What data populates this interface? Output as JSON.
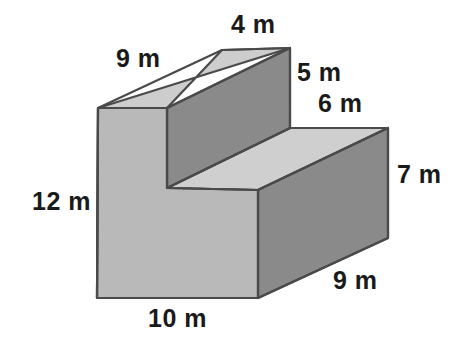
{
  "figure": {
    "unit": "m",
    "background_color": "#ffffff",
    "outline_color": "#4a4a4a",
    "faces": {
      "top_light_color": "#cfcfcf",
      "front_left_color": "#b8b8b8",
      "front_right_dark_color": "#8a8a8a",
      "riser_dark_color": "#8a8a8a"
    },
    "labels": [
      {
        "id": "top-left-depth",
        "text": "9 m",
        "value": 9,
        "unit": "m",
        "edge": "top-back-left-depth"
      },
      {
        "id": "top-back-width",
        "text": "4 m",
        "value": 4,
        "unit": "m",
        "edge": "top-back-width"
      },
      {
        "id": "upper-riser",
        "text": "5 m",
        "value": 5,
        "unit": "m",
        "edge": "upper-block-height"
      },
      {
        "id": "step-depth",
        "text": "6 m",
        "value": 6,
        "unit": "m",
        "edge": "step-top-depth"
      },
      {
        "id": "right-height",
        "text": "7 m",
        "value": 7,
        "unit": "m",
        "edge": "right-block-height"
      },
      {
        "id": "bottom-right-depth",
        "text": "9 m",
        "value": 9,
        "unit": "m",
        "edge": "bottom-right-depth"
      },
      {
        "id": "left-height",
        "text": "12 m",
        "value": 12,
        "unit": "m",
        "edge": "left-front-height"
      },
      {
        "id": "bottom-width",
        "text": "10 m",
        "value": 10,
        "unit": "m",
        "edge": "bottom-front-width"
      }
    ]
  }
}
